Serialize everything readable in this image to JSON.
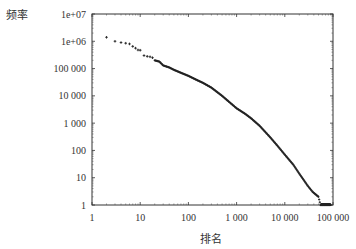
{
  "chart_data": {
    "type": "scatter",
    "title": "",
    "xlabel": "排名",
    "ylabel": "频率",
    "xscale": "log",
    "yscale": "log",
    "xlim": [
      1,
      100000
    ],
    "ylim": [
      1,
      10000000
    ],
    "grid": false,
    "legend": null,
    "x_ticks": [
      1,
      10,
      100,
      1000,
      10000,
      100000
    ],
    "x_tick_labels": [
      "1",
      "10",
      "100",
      "1 000",
      "10 000",
      "100 000"
    ],
    "y_ticks": [
      1,
      10,
      100,
      1000,
      10000,
      100000,
      1000000,
      10000000
    ],
    "y_tick_labels": [
      "1",
      "10",
      "100",
      "1 000",
      "10 000",
      "100 000",
      "1e+06",
      "1e+07"
    ],
    "series": [
      {
        "name": "rank-frequency",
        "marker": "+",
        "color": "#222222",
        "points": [
          [
            2,
            1400000
          ],
          [
            3,
            1000000
          ],
          [
            4,
            900000
          ],
          [
            5,
            850000
          ],
          [
            6,
            800000
          ],
          [
            7,
            650000
          ],
          [
            8,
            560000
          ],
          [
            9,
            480000
          ],
          [
            10,
            470000
          ],
          [
            12,
            300000
          ],
          [
            14,
            280000
          ],
          [
            16,
            270000
          ],
          [
            18,
            250000
          ],
          [
            20,
            200000
          ],
          [
            25,
            180000
          ],
          [
            30,
            130000
          ],
          [
            40,
            110000
          ],
          [
            50,
            90000
          ],
          [
            70,
            70000
          ],
          [
            100,
            54000
          ],
          [
            150,
            38000
          ],
          [
            200,
            30000
          ],
          [
            300,
            20000
          ],
          [
            500,
            10000
          ],
          [
            700,
            6000
          ],
          [
            1000,
            3500
          ],
          [
            1500,
            2200
          ],
          [
            2000,
            1500
          ],
          [
            3000,
            800
          ],
          [
            5000,
            300
          ],
          [
            7000,
            150
          ],
          [
            10000,
            70
          ],
          [
            15000,
            30
          ],
          [
            20000,
            14
          ],
          [
            25000,
            8
          ],
          [
            30000,
            5
          ],
          [
            38000,
            3
          ],
          [
            50000,
            2
          ],
          [
            55000,
            1
          ],
          [
            90000,
            1
          ]
        ]
      }
    ]
  }
}
